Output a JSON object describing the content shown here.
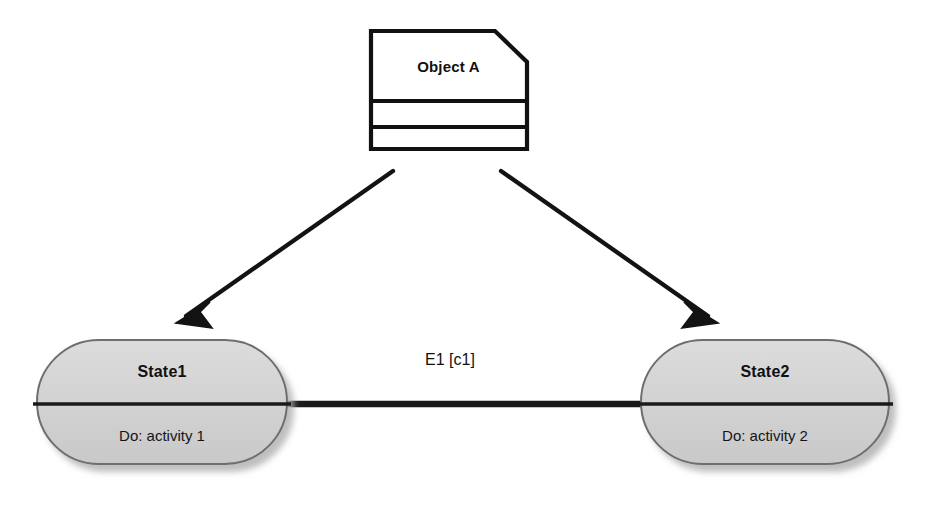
{
  "diagram": {
    "type": "uml-state-diagram",
    "background_color": "#ffffff",
    "stroke_color": "#111111",
    "state_fill_color": "#d2d2d2",
    "object_fill_color": "#ffffff"
  },
  "object_node": {
    "label": "Object A",
    "shape": "note-box-cut-corner",
    "compartments": 3
  },
  "states": [
    {
      "name": "State1",
      "activity": "Do: activity 1",
      "shape": "rounded-rectangle"
    },
    {
      "name": "State2",
      "activity": "Do: activity 2",
      "shape": "rounded-rectangle"
    }
  ],
  "transition": {
    "label": "E1 [c1]",
    "from": "State1",
    "to": "State2",
    "style": "thick-line"
  },
  "arrows": [
    {
      "name": "object-to-state1",
      "from": "Object A",
      "to": "State1",
      "head": "open-barbed"
    },
    {
      "name": "object-to-state2",
      "from": "Object A",
      "to": "State2",
      "head": "open-barbed"
    }
  ]
}
